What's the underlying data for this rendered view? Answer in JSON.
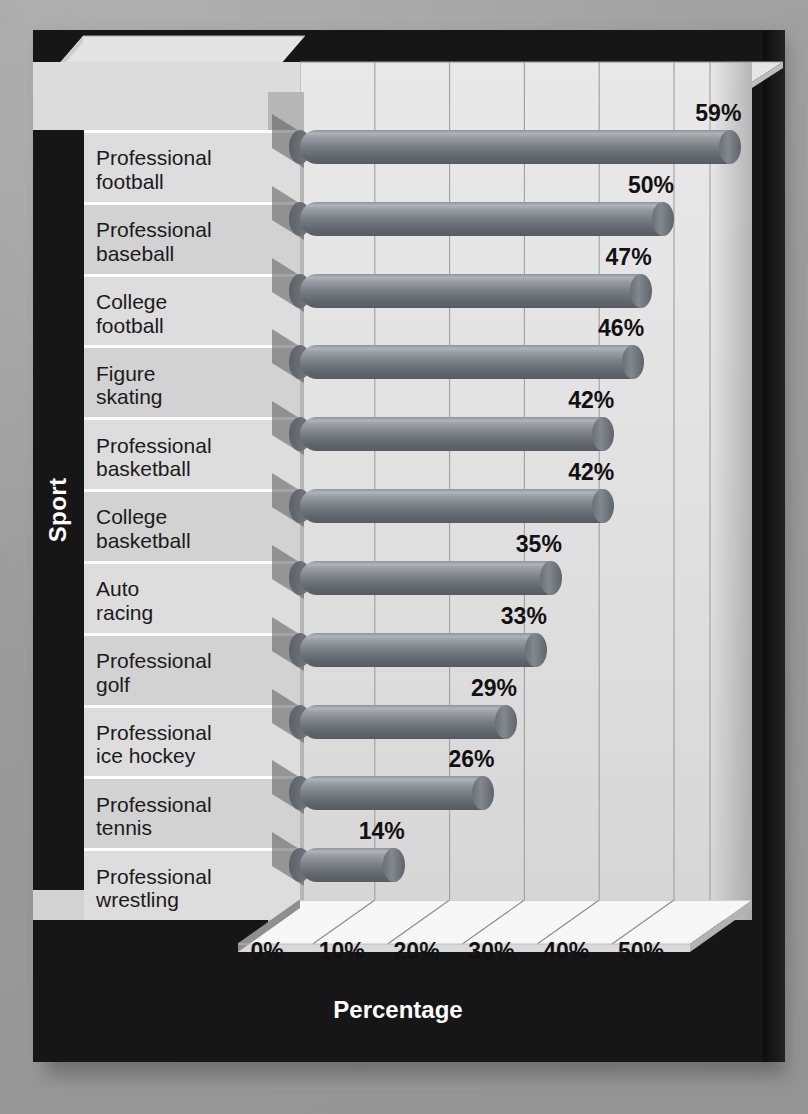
{
  "chart_data": {
    "type": "bar",
    "orientation": "horizontal",
    "title": "",
    "xlabel": "Percentage",
    "ylabel": "Sport",
    "xlim": [
      0,
      60
    ],
    "xticks": [
      "0%",
      "10%",
      "20%",
      "30%",
      "40%",
      "50%"
    ],
    "xtick_values": [
      0,
      10,
      20,
      30,
      40,
      50
    ],
    "grid": true,
    "legend": null,
    "categories": [
      "Professional football",
      "Professional baseball",
      "College football",
      "Figure skating",
      "Professional basketball",
      "College basketball",
      "Auto racing",
      "Professional golf",
      "Professional ice hockey",
      "Professional tennis",
      "Professional wrestling"
    ],
    "category_lines": [
      [
        "Professional",
        "football"
      ],
      [
        "Professional",
        "baseball"
      ],
      [
        "College",
        "football"
      ],
      [
        "Figure",
        "skating"
      ],
      [
        "Professional",
        "basketball"
      ],
      [
        "College",
        "basketball"
      ],
      [
        "Auto",
        "racing"
      ],
      [
        "Professional",
        "golf"
      ],
      [
        "Professional",
        "ice hockey"
      ],
      [
        "Professional",
        "tennis"
      ],
      [
        "Professional",
        "wrestling"
      ]
    ],
    "values": [
      59,
      50,
      47,
      46,
      42,
      42,
      35,
      33,
      29,
      26,
      14
    ],
    "value_labels": [
      "59%",
      "50%",
      "47%",
      "46%",
      "42%",
      "42%",
      "35%",
      "33%",
      "29%",
      "26%",
      "14%"
    ]
  },
  "axes": {
    "y_axis_title": "Sport",
    "x_axis_title": "Percentage"
  },
  "colors": {
    "background": "#9d9d9d",
    "frame": "#161616",
    "plot_wall": "#e2e2e2",
    "bar": "#767c82",
    "bar_highlight": "#aeb4b8",
    "bar_shade": "#565c62",
    "category_row_even": "#dddddd",
    "category_row_odd": "#d2d2d2",
    "text": "#111111",
    "axis_title_text": "#ffffff"
  }
}
